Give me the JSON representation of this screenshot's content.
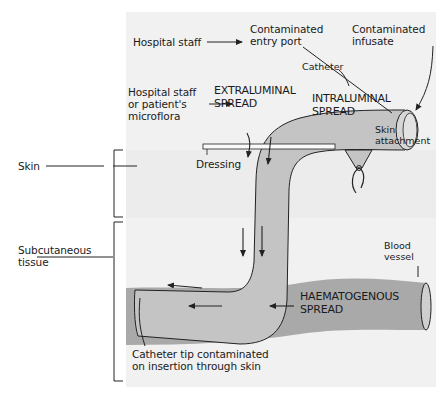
{
  "colors": {
    "panel_bg": "#f1f1f1",
    "catheter_fill": "#c2c2c2",
    "blood_vessel_fill": "#a7a7a7",
    "blood_vessel_light": "#cfcfcf",
    "line": "#222222"
  },
  "labels": {
    "hospital_staff": "Hospital staff",
    "contaminated_entry_port": [
      "Contaminated",
      "entry port"
    ],
    "contaminated_infusate": [
      "Contaminated",
      "infusate"
    ],
    "catheter": "Catheter",
    "hospital_staff_microflora": [
      "Hospital staff",
      "or patient's",
      "microflora"
    ],
    "extraluminal_spread": [
      "EXTRALUMINAL",
      "SPREAD"
    ],
    "intraluminal_spread": [
      "INTRALUMINAL",
      "SPREAD"
    ],
    "skin_attachment": [
      "Skin",
      "attachment"
    ],
    "dressing": "Dressing",
    "skin": "Skin",
    "subcutaneous_tissue": [
      "Subcutaneous",
      "tissue"
    ],
    "blood_vessel": [
      "Blood",
      "vessel"
    ],
    "haematogenous_spread": [
      "HAEMATOGENOUS",
      "SPREAD"
    ],
    "catheter_tip": [
      "Catheter tip contaminated",
      "on insertion through skin"
    ]
  }
}
